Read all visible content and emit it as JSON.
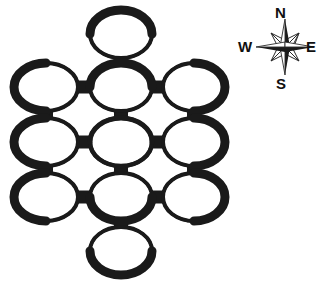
{
  "figure": {
    "kind": "node-network-diagram",
    "background_color": "#ffffff",
    "ink_color": "#1a1a1a",
    "width": 322,
    "height": 283
  },
  "diagram": {
    "name": "ring-node-lattice",
    "node_shape": "torus-ring-ellipse",
    "node_count": 11,
    "link_count": 14,
    "ring": {
      "outer_rx": 32,
      "outer_ry": 24,
      "stroke_min": 3,
      "stroke_max": 9,
      "fill": "#ffffff",
      "stroke": "#1a1a1a"
    },
    "nodes": [
      {
        "id": "top",
        "label": "",
        "cx": 121,
        "cy": 34,
        "rx": 31,
        "ry": 24
      },
      {
        "id": "row1-left",
        "label": "",
        "cx": 46,
        "cy": 87,
        "rx": 32,
        "ry": 24
      },
      {
        "id": "row1-center",
        "label": "",
        "cx": 121,
        "cy": 87,
        "rx": 31,
        "ry": 24
      },
      {
        "id": "row1-right",
        "label": "",
        "cx": 194,
        "cy": 87,
        "rx": 31,
        "ry": 24
      },
      {
        "id": "row2-left",
        "label": "",
        "cx": 46,
        "cy": 142,
        "rx": 32,
        "ry": 24
      },
      {
        "id": "row2-center",
        "label": "",
        "cx": 121,
        "cy": 142,
        "rx": 31,
        "ry": 24
      },
      {
        "id": "row2-right",
        "label": "",
        "cx": 194,
        "cy": 142,
        "rx": 31,
        "ry": 24
      },
      {
        "id": "row3-left",
        "label": "",
        "cx": 46,
        "cy": 197,
        "rx": 32,
        "ry": 24
      },
      {
        "id": "row3-center",
        "label": "",
        "cx": 121,
        "cy": 197,
        "rx": 31,
        "ry": 24
      },
      {
        "id": "row3-right",
        "label": "",
        "cx": 194,
        "cy": 197,
        "rx": 31,
        "ry": 24
      },
      {
        "id": "bottom",
        "label": "",
        "cx": 121,
        "cy": 251,
        "rx": 31,
        "ry": 24
      }
    ],
    "links": [
      {
        "from": "top",
        "to": "row1-center",
        "orientation": "vertical"
      },
      {
        "from": "row1-left",
        "to": "row1-center",
        "orientation": "horizontal"
      },
      {
        "from": "row1-center",
        "to": "row1-right",
        "orientation": "horizontal"
      },
      {
        "from": "row2-left",
        "to": "row2-center",
        "orientation": "horizontal"
      },
      {
        "from": "row2-center",
        "to": "row2-right",
        "orientation": "horizontal"
      },
      {
        "from": "row3-left",
        "to": "row3-center",
        "orientation": "horizontal"
      },
      {
        "from": "row3-center",
        "to": "row3-right",
        "orientation": "horizontal"
      },
      {
        "from": "row1-left",
        "to": "row2-left",
        "orientation": "vertical"
      },
      {
        "from": "row1-center",
        "to": "row2-center",
        "orientation": "vertical"
      },
      {
        "from": "row1-right",
        "to": "row2-right",
        "orientation": "vertical"
      },
      {
        "from": "row2-left",
        "to": "row3-left",
        "orientation": "vertical"
      },
      {
        "from": "row2-center",
        "to": "row3-center",
        "orientation": "vertical"
      },
      {
        "from": "row2-right",
        "to": "row3-right",
        "orientation": "vertical"
      },
      {
        "from": "row3-center",
        "to": "bottom",
        "orientation": "vertical"
      }
    ],
    "link_style": {
      "horizontal_thickness": 13,
      "vertical_thickness": 14,
      "color": "#1a1a1a"
    }
  },
  "compass": {
    "name": "compass-rose",
    "center_x": 285,
    "center_y": 47,
    "radius_major": 30,
    "radius_minor": 15,
    "points": 8,
    "color_major": "#1a1a1a",
    "color_minor": "#ffffff",
    "labels": {
      "north": "N",
      "south": "S",
      "west": "W",
      "east": "E"
    }
  }
}
